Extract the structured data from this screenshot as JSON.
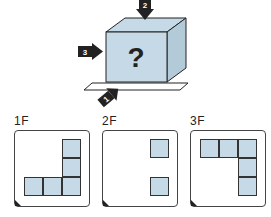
{
  "cube": {
    "center_mark": "?",
    "arrows": [
      {
        "id": 1,
        "label": "1",
        "direction": "front"
      },
      {
        "id": 2,
        "label": "2",
        "direction": "top"
      },
      {
        "id": 3,
        "label": "3",
        "direction": "left"
      }
    ],
    "face_color": "#c5d9e6"
  },
  "panels": [
    {
      "label": "1F",
      "cells": [
        [
          2,
          0
        ],
        [
          2,
          1
        ],
        [
          0,
          2
        ],
        [
          1,
          2
        ],
        [
          2,
          2
        ]
      ]
    },
    {
      "label": "2F",
      "cells": [
        [
          2,
          0
        ],
        [
          2,
          2
        ]
      ]
    },
    {
      "label": "3F",
      "cells": [
        [
          0,
          0
        ],
        [
          1,
          0
        ],
        [
          2,
          0
        ],
        [
          2,
          1
        ],
        [
          2,
          2
        ]
      ]
    }
  ]
}
